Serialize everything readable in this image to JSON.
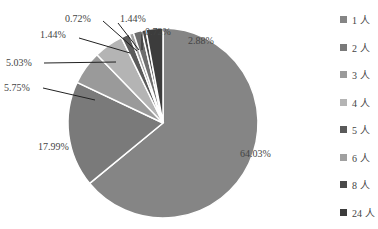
{
  "chart_data": {
    "type": "pie",
    "title": "",
    "categories": [
      "1 人",
      "2 人",
      "3 人",
      "4 人",
      "5 人",
      "6 人",
      "7 人",
      "8 人",
      "24 人"
    ],
    "values": [
      64.03,
      17.99,
      5.75,
      5.03,
      1.44,
      0.72,
      1.44,
      0.72,
      2.88
    ],
    "labels": [
      "64.03%",
      "17.99%",
      "5.75%",
      "5.03%",
      "1.44%",
      "0.72%",
      "1.44%",
      "0.72%",
      "2.88%"
    ],
    "colors": [
      "#858585",
      "#7a7a7a",
      "#9a9a9a",
      "#b4b4b4",
      "#5a5a5a",
      "#a0a0a0",
      "#6e6e6e",
      "#4a4a4a",
      "#3c3c3c"
    ],
    "legend_position": "right"
  },
  "legend": {
    "items": [
      {
        "label": "1 人",
        "color": "#858585"
      },
      {
        "label": "2 人",
        "color": "#7a7a7a"
      },
      {
        "label": "3 人",
        "color": "#9a9a9a"
      },
      {
        "label": "4 人",
        "color": "#b4b4b4"
      },
      {
        "label": "5 人",
        "color": "#5a5a5a"
      },
      {
        "label": "6 人",
        "color": "#a0a0a0"
      },
      {
        "label": "8 人",
        "color": "#4a4a4a"
      },
      {
        "label": "24 人",
        "color": "#3c3c3c"
      }
    ]
  }
}
